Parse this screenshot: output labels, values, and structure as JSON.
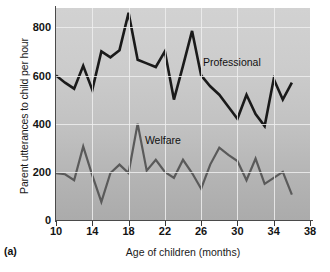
{
  "figure": {
    "panel_tag": "(a)"
  },
  "chart_data": {
    "type": "line",
    "title": "",
    "xlabel": "Age of children (months)",
    "ylabel": "Parent utterances to child per hour",
    "xlim": [
      10,
      38
    ],
    "ylim": [
      0,
      880
    ],
    "xticks": [
      10,
      14,
      18,
      22,
      26,
      30,
      34,
      38
    ],
    "yticks": [
      0,
      200,
      400,
      600,
      800
    ],
    "grid": true,
    "legend": "inline-annotations",
    "x": [
      10,
      11,
      12,
      13,
      14,
      15,
      16,
      17,
      18,
      19,
      20,
      21,
      22,
      23,
      24,
      25,
      26,
      27,
      28,
      29,
      30,
      31,
      32,
      33,
      34,
      35,
      36
    ],
    "series": [
      {
        "name": "Professional",
        "color": "#1a1a1a",
        "values": [
          600,
          570,
          545,
          640,
          540,
          700,
          675,
          705,
          860,
          665,
          650,
          635,
          700,
          500,
          640,
          785,
          600,
          555,
          520,
          470,
          420,
          520,
          440,
          390,
          585,
          500,
          570
        ]
      },
      {
        "name": "Welfare",
        "color": "#5a5a5a",
        "values": [
          195,
          190,
          165,
          305,
          185,
          75,
          195,
          230,
          195,
          400,
          205,
          250,
          200,
          175,
          250,
          195,
          130,
          230,
          300,
          270,
          245,
          165,
          255,
          150,
          175,
          200,
          105
        ]
      }
    ],
    "annotations": [
      {
        "text": "Professional",
        "x": 26.2,
        "y": 650
      },
      {
        "text": "Welfare",
        "x": 19.8,
        "y": 330
      }
    ]
  }
}
